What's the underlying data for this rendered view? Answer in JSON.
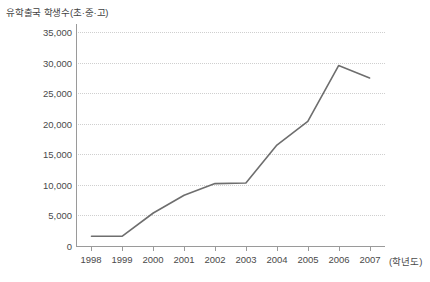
{
  "chart_data": {
    "type": "line",
    "title": "유학출국 학생수(초·중·고)",
    "xlabel": "(학년도)",
    "ylabel": "",
    "categories": [
      "1998",
      "1999",
      "2000",
      "2001",
      "2002",
      "2003",
      "2004",
      "2005",
      "2006",
      "2007"
    ],
    "series": [
      {
        "name": "유학출국 학생수",
        "values": [
          1600,
          1600,
          5400,
          8300,
          10200,
          10300,
          16500,
          20400,
          29500,
          27500
        ],
        "color": "#6e6e6e"
      }
    ],
    "ylim": [
      0,
      35000
    ],
    "ytick_labels": [
      "0",
      "5,000",
      "10,000",
      "15,000",
      "20,000",
      "25,000",
      "30,000",
      "35,000"
    ],
    "ytick_values": [
      0,
      5000,
      10000,
      15000,
      20000,
      25000,
      30000,
      35000
    ],
    "grid": true,
    "grid_axis": "y",
    "legend": "none",
    "x_unit_label": "(학년도)"
  },
  "style": {
    "line_color": "#6e6e6e",
    "axis_color": "#9a9a9a",
    "grid_color": "#cfcfcf",
    "text_color": "#4a4a4a",
    "background": "#ffffff"
  }
}
